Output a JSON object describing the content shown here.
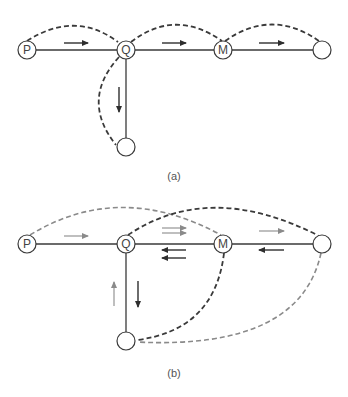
{
  "figure_a": {
    "caption": "(a)",
    "nodes": [
      {
        "id": "P",
        "label": "P"
      },
      {
        "id": "Q",
        "label": "Q"
      },
      {
        "id": "M",
        "label": "M"
      },
      {
        "id": "R",
        "label": ""
      },
      {
        "id": "S",
        "label": ""
      }
    ]
  },
  "figure_b": {
    "caption": "(b)",
    "nodes": [
      {
        "id": "P",
        "label": "P"
      },
      {
        "id": "Q",
        "label": "Q"
      },
      {
        "id": "M",
        "label": "M"
      },
      {
        "id": "R",
        "label": ""
      },
      {
        "id": "S",
        "label": ""
      }
    ]
  },
  "colors": {
    "dark": "#3a3a3a",
    "gray": "#8a8a8a"
  }
}
